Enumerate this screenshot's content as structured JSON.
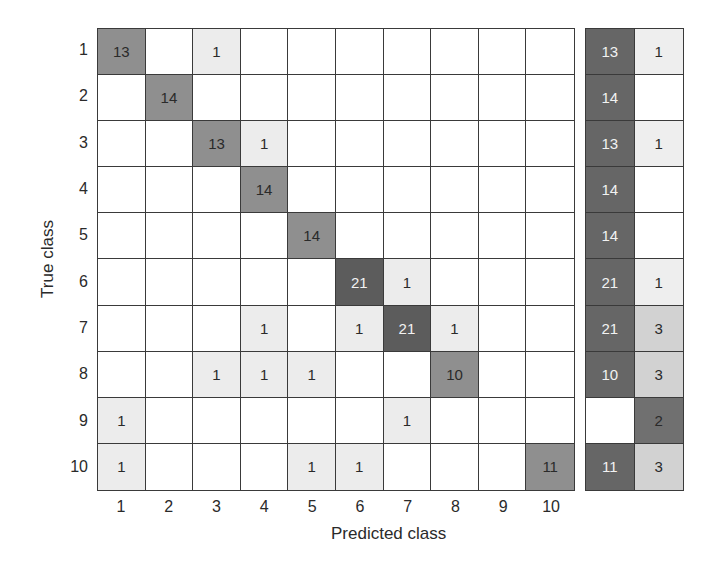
{
  "chart_data": {
    "type": "heatmap",
    "title": "",
    "xlabel": "Predicted class",
    "ylabel": "True class",
    "x_tick_labels": [
      "1",
      "2",
      "3",
      "4",
      "5",
      "6",
      "7",
      "8",
      "9",
      "10"
    ],
    "y_tick_labels": [
      "1",
      "2",
      "3",
      "4",
      "5",
      "6",
      "7",
      "8",
      "9",
      "10"
    ],
    "matrix": [
      [
        13,
        0,
        1,
        0,
        0,
        0,
        0,
        0,
        0,
        0
      ],
      [
        0,
        14,
        0,
        0,
        0,
        0,
        0,
        0,
        0,
        0
      ],
      [
        0,
        0,
        13,
        1,
        0,
        0,
        0,
        0,
        0,
        0
      ],
      [
        0,
        0,
        0,
        14,
        0,
        0,
        0,
        0,
        0,
        0
      ],
      [
        0,
        0,
        0,
        0,
        14,
        0,
        0,
        0,
        0,
        0
      ],
      [
        0,
        0,
        0,
        0,
        0,
        21,
        1,
        0,
        0,
        0
      ],
      [
        0,
        0,
        0,
        1,
        0,
        1,
        21,
        1,
        0,
        0
      ],
      [
        0,
        0,
        1,
        1,
        1,
        0,
        0,
        10,
        0,
        0
      ],
      [
        1,
        0,
        0,
        0,
        0,
        0,
        1,
        0,
        0,
        0
      ],
      [
        1,
        0,
        0,
        0,
        1,
        1,
        0,
        0,
        0,
        11
      ]
    ],
    "summary_columns": [
      "correct",
      "incorrect"
    ],
    "summary": [
      [
        13,
        1
      ],
      [
        14,
        0
      ],
      [
        13,
        1
      ],
      [
        14,
        0
      ],
      [
        14,
        0
      ],
      [
        21,
        1
      ],
      [
        21,
        3
      ],
      [
        10,
        3
      ],
      [
        0,
        2
      ],
      [
        11,
        3
      ]
    ],
    "colors": {
      "zero": "#ffffff",
      "one": "#ececec",
      "diag_mid": "#8f8f8f",
      "diag_high": "#5c5c5c",
      "summary_correct": "#666666",
      "summary_incorrect_low": "#eeeeee",
      "summary_incorrect_mid": "#d2d2d2",
      "summary_incorrect_high": "#707070",
      "grid_line": "#3a3a3a"
    }
  }
}
